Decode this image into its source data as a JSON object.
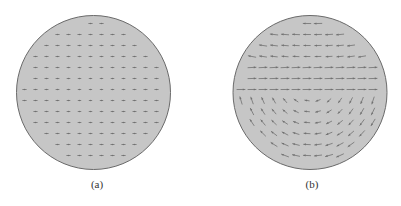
{
  "figure": {
    "top_text_fragment": "",
    "fill_color": "#c6c6c6",
    "border_color": "#6a6a6a",
    "marker_color": "#707070",
    "panels": [
      {
        "id": "a",
        "caption": "(a)",
        "center": [
          93.5,
          92.5
        ],
        "radius": 77,
        "field": "nearly-uniform",
        "description": "Grid of small dot/cross vector markers with near-zero magnitude"
      },
      {
        "id": "b",
        "caption": "(b)",
        "center": [
          310,
          92.5
        ],
        "radius": 77,
        "field": "circulating",
        "description": "Vector field with rightward flow across center, downward on right side, leftward along bottom, upward on left, leftward along top"
      }
    ]
  }
}
